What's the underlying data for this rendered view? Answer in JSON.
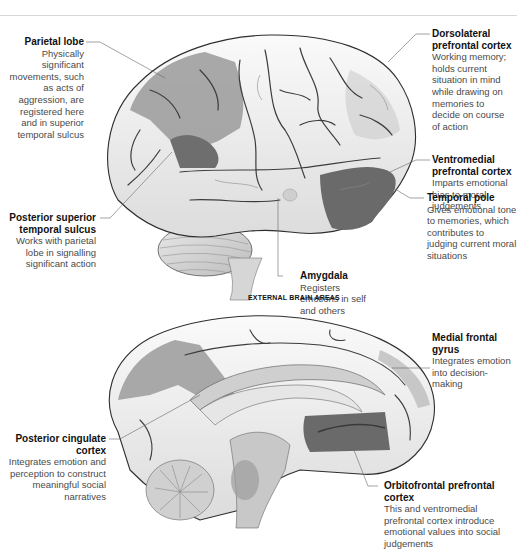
{
  "colors": {
    "highlight_dark": "#6b6b6b",
    "highlight_mid": "#8f8f8f",
    "highlight_light": "#ababab",
    "brain_fill": "#f4f4f4",
    "brain_outline": "#3a3a3a",
    "leader_line": "#666666"
  },
  "external": {
    "caption": "EXTERNAL BRAIN AREAS",
    "labels": [
      {
        "id": "parietal-lobe",
        "title": "Parietal lobe",
        "desc": "Physically significant movements, such as acts of aggression, are registered here and in superior temporal sulcus"
      },
      {
        "id": "dorsolateral-prefrontal-cortex",
        "title": "Dorsolateral prefrontal cortex",
        "desc": "Working memory; holds current situation in mind while drawing on memories to decide on course of action"
      },
      {
        "id": "ventromedial-prefrontal-cortex",
        "title": "Ventromedial prefrontal cortex",
        "desc": "Imparts emotional bias to moral judgements"
      },
      {
        "id": "temporal-pole",
        "title": "Temporal pole",
        "desc": "Gives emotional tone to memories, which contributes to judging current moral situations"
      },
      {
        "id": "posterior-superior-temporal-sulcus",
        "title": "Posterior superior temporal sulcus",
        "desc": "Works with parietal lobe in signalling significant action"
      },
      {
        "id": "amygdala",
        "title": "Amygdala",
        "desc": "Registers emotions in self and others"
      }
    ]
  },
  "internal": {
    "labels": [
      {
        "id": "medial-frontal-gyrus",
        "title": "Medial frontal gyrus",
        "desc": "Integrates emotion into decision-making"
      },
      {
        "id": "posterior-cingulate-cortex",
        "title": "Posterior cingulate cortex",
        "desc": "Integrates emotion and perception to construct meaningful social narratives"
      },
      {
        "id": "orbitofrontal-prefrontal-cortex",
        "title": "Orbitofrontal prefrontal cortex",
        "desc": "This and ventromedial prefrontal cortex introduce emotional values into social judgements"
      }
    ]
  }
}
